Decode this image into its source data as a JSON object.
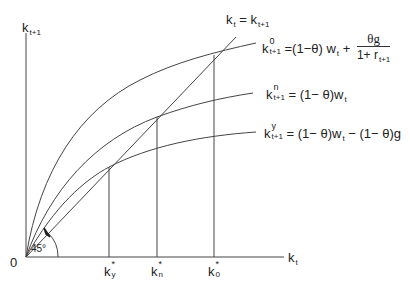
{
  "diagram": {
    "axes": {
      "y_label_main": "k",
      "y_label_sub": "t+1",
      "x_label_main": "k",
      "x_label_sub": "t",
      "origin_label": "0",
      "angle_label": "45°"
    },
    "diagonal": {
      "label_left_main": "k",
      "label_left_sub": "t",
      "label_eq": "=",
      "label_right_main": "k",
      "label_right_sub": "t+1"
    },
    "curves": [
      {
        "id": "old",
        "label_main": "k",
        "label_sup": "0",
        "label_sub": "t+1",
        "equation_part1": "=(1−θ) w",
        "equation_part1_sub": "t",
        "equation_plus": "+",
        "fraction_num": "θg",
        "fraction_den_main": "1+ r",
        "fraction_den_sub": "t+1"
      },
      {
        "id": "neutral",
        "label_main": "k",
        "label_sup": "n",
        "label_sub": "t+1",
        "equation": "= (1− θ)w",
        "equation_sub": "t"
      },
      {
        "id": "young",
        "label_main": "k",
        "label_sup": "y",
        "label_sub": "t+1",
        "equation": "= (1− θ)w",
        "equation_sub": "t",
        "equation_tail": " − (1− θ)g"
      }
    ],
    "steady_states": [
      {
        "main": "k",
        "sup": "*",
        "sub": "y"
      },
      {
        "main": "k",
        "sup": "*",
        "sub": "n"
      },
      {
        "main": "k",
        "sup": "*",
        "sub": "0"
      }
    ]
  }
}
